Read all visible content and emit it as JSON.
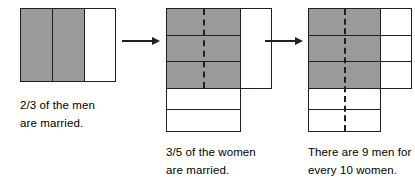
{
  "figure": {
    "colors": {
      "shaded": "#9a9a9a",
      "unshaded": "#ffffff",
      "stroke": "#231f20",
      "background": "#ffffff"
    }
  },
  "panels": [
    {
      "id": "panel-men",
      "caption_line1": "2/3 of the men",
      "caption_line2": "are married.",
      "model": {
        "orientation": "vertical-columns",
        "total_parts": 3,
        "shaded_parts": 2,
        "unshaded_parts": 1,
        "fraction_label": "2/3",
        "dashed_divider": false
      }
    },
    {
      "id": "panel-women",
      "caption_line1": "3/5 of the women",
      "caption_line2": "are married.",
      "model": {
        "orientation": "horizontal-rows",
        "total_parts": 5,
        "shaded_parts": 3,
        "unshaded_parts": 2,
        "fraction_label": "3/5",
        "dashed_divider": true,
        "dashed_extent_rows": 3,
        "side_column": {
          "rows": 1,
          "spans_rows": 3,
          "shaded": false
        }
      }
    },
    {
      "id": "panel-ratio",
      "caption_line1": "There are 9 men for",
      "caption_line2": "every 10 women.",
      "model": {
        "orientation": "horizontal-rows",
        "total_parts": 5,
        "shaded_parts": 3,
        "unshaded_parts": 2,
        "dashed_divider": true,
        "dashed_extent_rows": 5,
        "side_column": {
          "rows": 3,
          "spans_rows": 1,
          "shaded": false
        },
        "men_count": 9,
        "women_count": 10,
        "ratio_label": "9 : 10"
      }
    }
  ],
  "arrows": [
    {
      "id": "arrow-1",
      "direction": "right",
      "from": "panel-men",
      "to": "panel-women"
    },
    {
      "id": "arrow-2",
      "direction": "right",
      "from": "panel-women",
      "to": "panel-ratio"
    }
  ]
}
